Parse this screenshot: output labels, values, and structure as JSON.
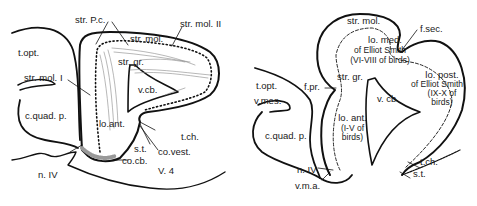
{
  "figure": {
    "type": "anatomical diagram (cerebellum sagittal sections)",
    "left_panel": {
      "specimen_label": "V. 4",
      "labels": {
        "t_opt": "t.opt.",
        "str_pc": "str. P.c.",
        "str_mol_ii": "str. mol. II",
        "str_mol": "str. mol.",
        "str_gr": "str. gr.",
        "str_mol_i": "str. mol. I",
        "v_cb": "v.cb.",
        "c_quad_p": "c.quad. p.",
        "lo_ant": "lo.ant.",
        "t_ch": "t.ch.",
        "s_t": "s.t.",
        "co_vest": "co.vest.",
        "co_cb": "co.cb.",
        "n_iv": "n. IV"
      }
    },
    "right_panel": {
      "labels": {
        "str_mol": "str. mol.",
        "f_sec": "f.sec.",
        "lo_med_1": "lo. med.",
        "lo_med_2": "of Elliot Smith",
        "lo_med_3": "(VI-VIII of birds)",
        "t_opt": "t.opt.",
        "f_pr": "f.pr.",
        "str_gr": "str. gr.",
        "lo_post_1": "lo. post.",
        "lo_post_2": "of Elliot Smith",
        "lo_post_3": "(IX-X of",
        "lo_post_4": "birds)",
        "v_mes": "v.mes.",
        "v_cb": "v. cb.",
        "c_quad_p": "c.quad. p.",
        "lo_ant_1": "lo. ant.",
        "lo_ant_2": "(I-V of",
        "lo_ant_3": "birds)",
        "t_ch": "t.ch.",
        "s_t": "s.t.",
        "n_iv": "n. IV",
        "v_m_a": "v.m.a."
      }
    }
  }
}
